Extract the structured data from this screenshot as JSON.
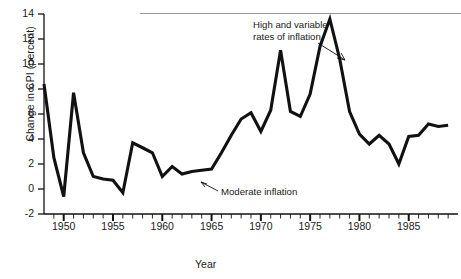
{
  "chart_data": {
    "type": "line",
    "title": "",
    "xlabel": "Year",
    "ylabel": "Change in CPI (percent)",
    "xlim": [
      1948,
      1990
    ],
    "ylim": [
      -2,
      14
    ],
    "ytick_values": [
      -2,
      0,
      2,
      4,
      6,
      8,
      10,
      12,
      14
    ],
    "ytick_labels": [
      "-2",
      "0",
      "2",
      "4",
      "6",
      "8",
      "10",
      "12",
      "14"
    ],
    "xtick_labels": [
      "1950",
      "1955",
      "1960",
      "1965",
      "1970",
      "1975",
      "1980",
      "1985"
    ],
    "xtick_values": [
      1950,
      1955,
      1960,
      1965,
      1970,
      1975,
      1980,
      1985
    ],
    "minor_tick_interval": 1,
    "major_tick_interval": 5,
    "grid": false,
    "legend": false,
    "line_color": "#111111",
    "x": [
      1948,
      1949,
      1950,
      1951,
      1952,
      1953,
      1954,
      1955,
      1956,
      1957,
      1958,
      1959,
      1960,
      1961,
      1962,
      1963,
      1964,
      1965,
      1966,
      1967,
      1968,
      1969,
      1970,
      1971,
      1972,
      1973,
      1974,
      1975,
      1976,
      1977,
      1978,
      1979,
      1980,
      1981,
      1982,
      1983,
      1984,
      1985,
      1986,
      1987,
      1988,
      1989
    ],
    "values": [
      8.4,
      2.5,
      -0.6,
      7.7,
      2.9,
      1.0,
      0.8,
      0.7,
      -0.3,
      3.7,
      3.3,
      2.9,
      1.0,
      1.8,
      1.2,
      1.4,
      1.5,
      1.6,
      2.9,
      4.3,
      5.6,
      6.1,
      4.6,
      6.3,
      11.1,
      6.2,
      5.8,
      7.6,
      11.4,
      13.6,
      10.4,
      6.2,
      4.4,
      3.6,
      4.3,
      3.6,
      2.0,
      4.2,
      4.3,
      5.2,
      5.0,
      5.1
    ],
    "annotations": [
      {
        "text_line1": "High and variable",
        "text_line2": "rates of inflation",
        "points_to": "1977 rising segment"
      },
      {
        "text_line1": "Moderate inflation",
        "text_line2": "",
        "points_to": "1963 flat segment"
      }
    ]
  },
  "axis": {
    "y_title": "Change in CPI (percent)",
    "x_title": "Year"
  },
  "annotation_high": {
    "line1": "High and variable",
    "line2": "rates of inflation"
  },
  "annotation_moderate": {
    "line1": "Moderate inflation"
  }
}
